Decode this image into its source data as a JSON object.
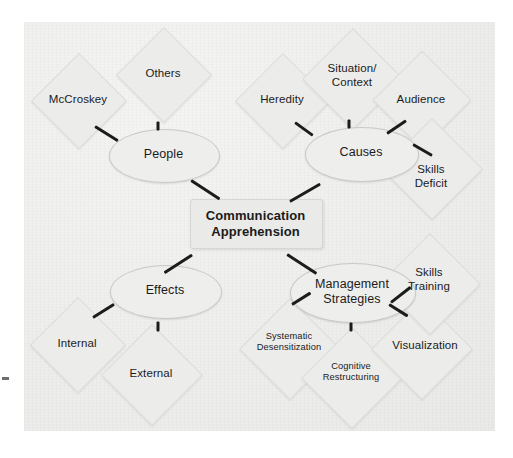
{
  "diagram": {
    "title_node": {
      "label": "Communication\nApprehension"
    },
    "branches": [
      {
        "id": "people",
        "label": "People",
        "leaves": [
          {
            "id": "mccroskey",
            "label": "McCroskey"
          },
          {
            "id": "others",
            "label": "Others"
          }
        ]
      },
      {
        "id": "causes",
        "label": "Causes",
        "leaves": [
          {
            "id": "heredity",
            "label": "Heredity"
          },
          {
            "id": "situation-context",
            "label": "Situation/\nContext"
          },
          {
            "id": "audience",
            "label": "Audience"
          },
          {
            "id": "skills-deficit",
            "label": "Skills\nDeficit"
          }
        ]
      },
      {
        "id": "effects",
        "label": "Effects",
        "leaves": [
          {
            "id": "internal",
            "label": "Internal"
          },
          {
            "id": "external",
            "label": "External"
          }
        ]
      },
      {
        "id": "management-strategies",
        "label": "Management\nStrategies",
        "leaves": [
          {
            "id": "systematic-desensitization",
            "label": "Systematic\nDesensitization"
          },
          {
            "id": "cognitive-restructuring",
            "label": "Cognitive\nRestructuring"
          },
          {
            "id": "visualization",
            "label": "Visualization"
          },
          {
            "id": "skills-training",
            "label": "Skills\nTraining"
          }
        ]
      }
    ],
    "colors": {
      "page_background": "#ffffff",
      "canvas_background": "#eeeeec",
      "shape_fill": "#ececeb",
      "shape_border": "#dcdcda",
      "ellipse_fill": "#eeeeec",
      "ellipse_border": "#c9c9c6",
      "center_fill": "#eaeae8",
      "connector": "#1c1c1c",
      "text": "#1b1b1b"
    }
  }
}
